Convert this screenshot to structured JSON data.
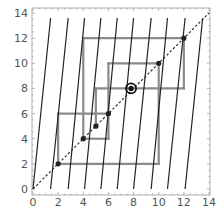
{
  "chart_data": {
    "type": "line",
    "title": "",
    "xlabel": "",
    "ylabel": "",
    "xlim": [
      0,
      14
    ],
    "ylim": [
      0,
      14
    ],
    "grid": false,
    "frame": true,
    "x_ticks": [
      0,
      2,
      4,
      6,
      8,
      10,
      12,
      14
    ],
    "y_ticks": [
      0,
      2,
      4,
      6,
      8,
      10,
      12,
      14
    ],
    "x_tick_labels": [
      "0",
      "2",
      "4",
      "6",
      "8",
      "10",
      "12",
      "14"
    ],
    "y_tick_labels": [
      "0",
      "2",
      "4",
      "6",
      "8",
      "10",
      "12",
      "14"
    ],
    "series": [
      {
        "name": "diagonal y=x",
        "style": "dashed",
        "color": "#222222",
        "points": [
          [
            0,
            0
          ],
          [
            14,
            14
          ]
        ]
      },
      {
        "name": "map branches",
        "style": "solid",
        "color": "#222222",
        "segments": [
          [
            [
              0.0,
              0
            ],
            [
              1.4,
              13.6
            ]
          ],
          [
            [
              1.4,
              0
            ],
            [
              2.8,
              13.6
            ]
          ],
          [
            [
              2.8,
              0
            ],
            [
              4.1,
              13.6
            ]
          ],
          [
            [
              4.1,
              0
            ],
            [
              5.4,
              13.6
            ]
          ],
          [
            [
              5.4,
              0
            ],
            [
              6.7,
              13.6
            ]
          ],
          [
            [
              6.7,
              0
            ],
            [
              8.0,
              13.6
            ]
          ],
          [
            [
              8.0,
              0
            ],
            [
              9.4,
              13.6
            ]
          ],
          [
            [
              9.4,
              0
            ],
            [
              10.7,
              13.6
            ]
          ],
          [
            [
              10.7,
              0
            ],
            [
              12.1,
              13.6
            ]
          ],
          [
            [
              12.1,
              0
            ],
            [
              13.5,
              13.6
            ]
          ]
        ]
      },
      {
        "name": "cobweb orbit",
        "style": "solid",
        "color": "#8a8a8a",
        "segments": [
          [
            [
              2,
              2
            ],
            [
              10,
              2
            ]
          ],
          [
            [
              10,
              2
            ],
            [
              10,
              10
            ]
          ],
          [
            [
              6,
              10
            ],
            [
              10,
              10
            ]
          ],
          [
            [
              6,
              4
            ],
            [
              6,
              10
            ]
          ],
          [
            [
              4,
              4
            ],
            [
              6,
              4
            ]
          ],
          [
            [
              4,
              4
            ],
            [
              4,
              12
            ]
          ],
          [
            [
              4,
              12
            ],
            [
              12,
              12
            ]
          ],
          [
            [
              12,
              8
            ],
            [
              12,
              12
            ]
          ],
          [
            [
              5,
              8
            ],
            [
              12,
              8
            ]
          ],
          [
            [
              5,
              5
            ],
            [
              5,
              8
            ]
          ],
          [
            [
              2,
              6
            ],
            [
              6,
              6
            ]
          ],
          [
            [
              2,
              2
            ],
            [
              2,
              6
            ]
          ]
        ]
      },
      {
        "name": "orbit points",
        "style": "markers",
        "color": "#222222",
        "points": [
          [
            2,
            2
          ],
          [
            4,
            4
          ],
          [
            5,
            5
          ],
          [
            6,
            6
          ],
          [
            10,
            10
          ],
          [
            12,
            12
          ]
        ]
      },
      {
        "name": "highlighted fixed point",
        "style": "circle-marker",
        "color": "#111111",
        "points": [
          [
            7.8,
            8
          ]
        ]
      }
    ]
  }
}
